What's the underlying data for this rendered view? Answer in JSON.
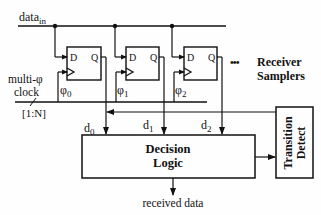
{
  "diagram": {
    "input_label": "data",
    "input_subscript": "in",
    "clock_label_line1": "multi-φ",
    "clock_label_line2": "clock",
    "bus_width_label": "[1:N]",
    "flip_flops": [
      {
        "d_label": "D",
        "q_label": "Q",
        "phase": "φ",
        "phase_sub": "0",
        "output": "d",
        "output_sub": "0"
      },
      {
        "d_label": "D",
        "q_label": "Q",
        "phase": "φ",
        "phase_sub": "1",
        "output": "d",
        "output_sub": "1"
      },
      {
        "d_label": "D",
        "q_label": "Q",
        "phase": "φ",
        "phase_sub": "2",
        "output": "d",
        "output_sub": "2"
      }
    ],
    "ellipsis": "•••",
    "samplers_label_line1": "Receiver",
    "samplers_label_line2": "Samplers",
    "decision_block_line1": "Decision",
    "decision_block_line2": "Logic",
    "transition_block_line1": "Transition",
    "transition_block_line2": "Detect",
    "output_label": "received data"
  }
}
